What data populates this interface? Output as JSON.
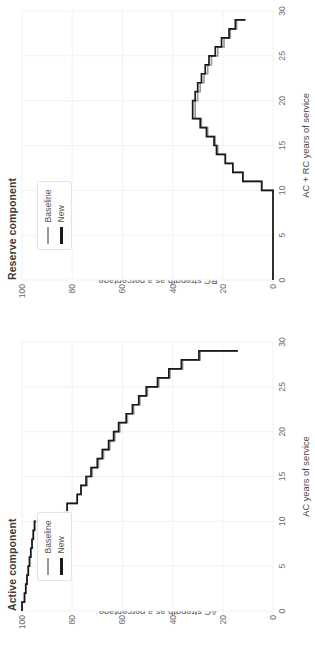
{
  "figure": {
    "orientation": "rotated-90",
    "background": "#ffffff",
    "gridline_color": "#f2f2f2",
    "baseline_color": "#999999",
    "new_color": "#1a1a1a"
  },
  "legend": {
    "baseline_label": "Baseline",
    "new_label": "New"
  },
  "panels": {
    "reserve": {
      "title": "Reserve component",
      "xlabel": "AC + RC years of service",
      "ylabel_line1": "RC strength as a percentage",
      "ylabel_line2": "of initial AC accessions"
    },
    "active": {
      "title": "Active component",
      "xlabel": "AC years of service",
      "ylabel_line1": "AC strength as a percentage",
      "ylabel_line2": "of initial AC accessions"
    }
  },
  "chart_data": [
    {
      "id": "active",
      "type": "line",
      "title": "Active component",
      "xlabel": "AC years of service",
      "ylabel": "AC strength as a percentage of initial AC accessions",
      "xlim": [
        0,
        30
      ],
      "ylim": [
        0,
        100
      ],
      "xticks": [
        0,
        5,
        10,
        15,
        20,
        25,
        30
      ],
      "yticks": [
        0,
        20,
        40,
        60,
        80,
        100
      ],
      "grid": true,
      "legend_position": "top-left",
      "x": [
        0,
        1,
        2,
        3,
        4,
        5,
        6,
        7,
        8,
        9,
        10,
        11,
        12,
        13,
        14,
        15,
        16,
        17,
        18,
        19,
        20,
        21,
        22,
        23,
        24,
        25,
        26,
        27,
        28,
        29
      ],
      "series": [
        {
          "name": "Baseline",
          "color": "#999999",
          "values": [
            100,
            99,
            98.5,
            98,
            97.5,
            97,
            96.5,
            96,
            95.5,
            95,
            83,
            82,
            78,
            76.5,
            74,
            72,
            69.5,
            67.5,
            65,
            63,
            61,
            58,
            55.5,
            53,
            50,
            45.5,
            41,
            36,
            29,
            14
          ]
        },
        {
          "name": "New",
          "color": "#1a1a1a",
          "values": [
            100,
            99,
            98.5,
            98,
            97.5,
            97,
            96.5,
            96,
            95.5,
            95,
            83,
            82,
            78,
            76.5,
            74.5,
            72.5,
            70,
            68,
            65.5,
            63.5,
            61.5,
            58.5,
            56,
            53.5,
            50.5,
            46,
            41.5,
            36.5,
            29.5,
            14
          ]
        }
      ]
    },
    {
      "id": "reserve",
      "type": "line",
      "title": "Reserve component",
      "xlabel": "AC + RC years of service",
      "ylabel": "RC strength as a percentage of initial AC accessions",
      "xlim": [
        0,
        30
      ],
      "ylim": [
        0,
        100
      ],
      "xticks": [
        0,
        5,
        10,
        15,
        20,
        25,
        30
      ],
      "yticks": [
        0,
        20,
        40,
        60,
        80,
        100
      ],
      "grid": true,
      "legend_position": "top-left",
      "x": [
        0,
        1,
        2,
        3,
        4,
        5,
        6,
        7,
        8,
        9,
        10,
        11,
        12,
        13,
        14,
        15,
        16,
        17,
        18,
        19,
        20,
        21,
        22,
        23,
        24,
        25,
        26,
        27,
        28,
        29
      ],
      "series": [
        {
          "name": "Baseline",
          "color": "#999999",
          "values": [
            0,
            0,
            0,
            0,
            0,
            0,
            0,
            0,
            0,
            0,
            4.5,
            12,
            16,
            19,
            22,
            23,
            26,
            28.5,
            31,
            31,
            30,
            29,
            27.5,
            26,
            24.5,
            22,
            19.5,
            17,
            14.5,
            11
          ]
        },
        {
          "name": "New",
          "color": "#1a1a1a",
          "values": [
            0,
            0,
            0,
            0,
            0,
            0,
            0,
            0,
            0,
            0,
            4.5,
            12,
            16,
            19,
            22.5,
            23.5,
            26.5,
            29,
            32,
            32,
            31,
            30,
            28.5,
            27,
            25.5,
            23,
            20.5,
            17.5,
            15,
            11
          ]
        }
      ]
    }
  ]
}
